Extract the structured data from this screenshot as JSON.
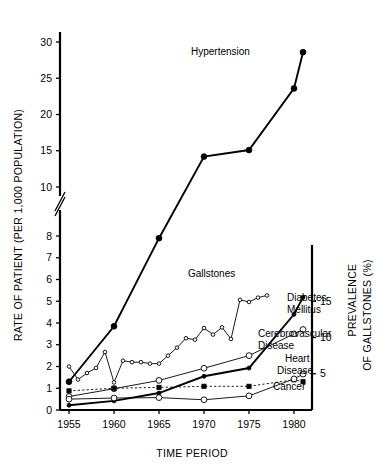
{
  "chart_data": {
    "type": "line",
    "title": "",
    "xlabel": "TIME PERIOD",
    "ylabel": "RATE OF PATIENT (PER 1,000 POPULATION)",
    "y2label": "PREVALENCE OF GALLSTONES (%)",
    "grid": false,
    "legend_position": "inline-annotations",
    "x_ticks": [
      "1955",
      "1960",
      "1965",
      "1970",
      "1975",
      "1980"
    ],
    "x_tick_values": [
      1955,
      1960,
      1965,
      1970,
      1975,
      1980
    ],
    "xlim": [
      1954,
      1982
    ],
    "y_ticks_lower": [
      "0",
      "1",
      "2",
      "3",
      "4",
      "5",
      "6",
      "7",
      "8"
    ],
    "y_ticks_upper": [
      "10",
      "15",
      "20",
      "25",
      "30"
    ],
    "ylim": [
      0,
      31
    ],
    "y_axis_break_between": [
      8,
      10
    ],
    "y2_ticks": [
      "5",
      "10",
      "15"
    ],
    "y2lim": [
      0,
      16.5
    ],
    "y2_scale_note": "right axis: prevalence % maps 0-16.5 onto left 0-5.5",
    "series": [
      {
        "name": "Hypertension",
        "label": "Hypertension",
        "marker": "filled-circle",
        "line": "thick",
        "axis": "left",
        "x": [
          1955,
          1960,
          1965,
          1970,
          1975,
          1980,
          1981
        ],
        "values": [
          1.3,
          3.85,
          7.9,
          14.2,
          15.1,
          23.6,
          28.6
        ]
      },
      {
        "name": "Gallstones",
        "label": "Gallstones",
        "marker": "open-small",
        "line": "thin",
        "axis": "right",
        "x": [
          1955,
          1956,
          1957,
          1958,
          1959,
          1960,
          1961,
          1962,
          1963,
          1964,
          1965,
          1966,
          1967,
          1968,
          1969,
          1970,
          1971,
          1972,
          1973,
          1974,
          1975,
          1976,
          1977
        ],
        "values": [
          6.0,
          4.2,
          5.1,
          5.8,
          8.0,
          3.8,
          6.8,
          6.6,
          6.6,
          6.4,
          6.4,
          7.5,
          8.6,
          9.9,
          9.7,
          11.3,
          10.4,
          11.4,
          9.8,
          15.2,
          14.9,
          15.5,
          15.8
        ]
      },
      {
        "name": "Diabetes Mellitus",
        "label": "Diabetes Mellitus",
        "marker": "filled-small",
        "line": "thick",
        "axis": "left",
        "x": [
          1955,
          1960,
          1965,
          1970,
          1975,
          1980,
          1981
        ],
        "values": [
          0.22,
          0.42,
          0.78,
          1.55,
          1.93,
          4.4,
          5.18
        ]
      },
      {
        "name": "Cerebrovascular Disease",
        "label": "Cerebrovascular Disease",
        "marker": "open-circle",
        "line": "thin",
        "axis": "left",
        "x": [
          1955,
          1960,
          1965,
          1970,
          1975,
          1980,
          1981
        ],
        "values": [
          0.62,
          0.98,
          1.36,
          1.92,
          2.5,
          3.5,
          3.7
        ]
      },
      {
        "name": "Heart Disease",
        "label": "Heart Disease",
        "marker": "filled-square",
        "line": "dotted",
        "axis": "left",
        "x": [
          1955,
          1960,
          1965,
          1970,
          1975,
          1980,
          1981
        ],
        "values": [
          0.88,
          1.0,
          1.04,
          1.09,
          1.09,
          1.39,
          1.3
        ]
      },
      {
        "name": "Cancer",
        "label": "Cancer",
        "marker": "open-circle",
        "line": "thin",
        "axis": "left",
        "x": [
          1955,
          1960,
          1965,
          1970,
          1975,
          1980,
          1981
        ],
        "values": [
          0.5,
          0.55,
          0.57,
          0.47,
          0.65,
          1.43,
          1.65
        ]
      }
    ],
    "annotations": [
      {
        "text": "Hypertension",
        "x_px": 191,
        "y_px": 55
      },
      {
        "text": "Gallstones",
        "x_px": 188,
        "y_px": 277
      },
      {
        "text": "Diabetes",
        "x_px": 287,
        "y_px": 301
      },
      {
        "text": "Mellitus",
        "x_px": 287,
        "y_px": 313
      },
      {
        "text": "Cerebrovascular",
        "x_px": 258,
        "y_px": 337
      },
      {
        "text": "Disease",
        "x_px": 258,
        "y_px": 349
      },
      {
        "text": "Heart",
        "x_px": 285,
        "y_px": 362
      },
      {
        "text": "Disease",
        "x_px": 277,
        "y_px": 374
      },
      {
        "text": "Cancer",
        "x_px": 273,
        "y_px": 390
      }
    ]
  }
}
